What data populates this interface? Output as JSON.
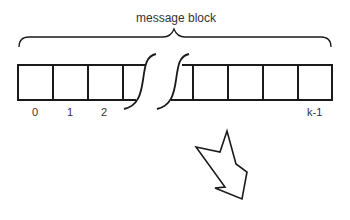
{
  "diagram": {
    "title": "message block",
    "cell_labels": {
      "first": "0",
      "second": "1",
      "third": "2",
      "last": "k-1"
    },
    "stroke_color": "#1a1a1a",
    "text_color": "#333333",
    "arrow": {
      "direction": "down-right",
      "style": "outline"
    }
  }
}
